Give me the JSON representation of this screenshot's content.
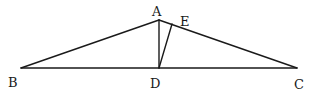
{
  "diagram": {
    "type": "geometry",
    "points": {
      "A": {
        "label": "A",
        "x": 159,
        "y": 20,
        "label_x": 152,
        "label_y": 16
      },
      "B": {
        "label": "B",
        "x": 21,
        "y": 68,
        "label_x": 8,
        "label_y": 87
      },
      "C": {
        "label": "C",
        "x": 297,
        "y": 68,
        "label_x": 294,
        "label_y": 89
      },
      "D": {
        "label": "D",
        "x": 159,
        "y": 68,
        "label_x": 150,
        "label_y": 88
      },
      "E": {
        "label": "E",
        "x": 172,
        "y": 24,
        "label_x": 180,
        "label_y": 26
      }
    },
    "segments": [
      {
        "from": "A",
        "to": "B"
      },
      {
        "from": "A",
        "to": "C"
      },
      {
        "from": "B",
        "to": "C"
      },
      {
        "from": "A",
        "to": "D"
      },
      {
        "from": "D",
        "to": "E"
      }
    ],
    "stroke_color": "#1a1a1a"
  }
}
